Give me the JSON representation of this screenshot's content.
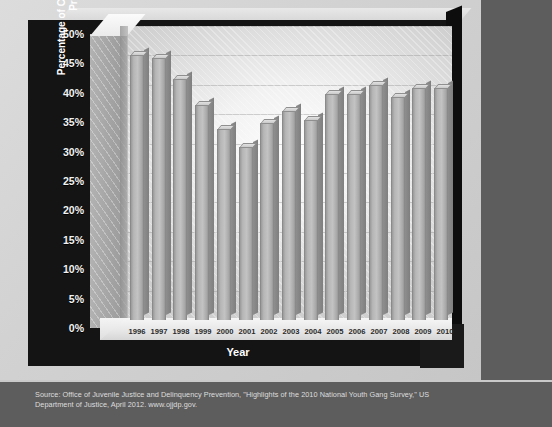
{
  "figure": {
    "source_note": "Source: Office of Juvenile Justice and Delinquency Prevention, \"Highlights of the 2010 National Youth Gang Survey,\" US Department of Justice, April 2012. www.ojjdp.gov.",
    "background_color": "#5d5d5d",
    "frame_color": "#141414",
    "bar_color": "#b6b6b6"
  },
  "chart_data": {
    "type": "bar",
    "title": "",
    "xlabel": "Year",
    "ylabel": "Percentage of Cities Reporting Gang Problems",
    "ylim": [
      0,
      50
    ],
    "ytick_labels": [
      "50%",
      "45%",
      "40%",
      "35%",
      "30%",
      "25%",
      "20%",
      "15%",
      "10%",
      "5%",
      "0%"
    ],
    "ytick_values": [
      50,
      45,
      40,
      35,
      30,
      25,
      20,
      15,
      10,
      5,
      0
    ],
    "grid": true,
    "legend": "none",
    "units": "percent",
    "categories": [
      "1996",
      "1997",
      "1998",
      "1999",
      "2000",
      "2001",
      "2002",
      "2003",
      "2004",
      "2005",
      "2006",
      "2007",
      "2008",
      "2009",
      "2010"
    ],
    "values": [
      45,
      44.5,
      41,
      36.5,
      32.5,
      29.5,
      33.5,
      35.5,
      34,
      38.5,
      38.5,
      40,
      38,
      39.5,
      39.5
    ]
  }
}
